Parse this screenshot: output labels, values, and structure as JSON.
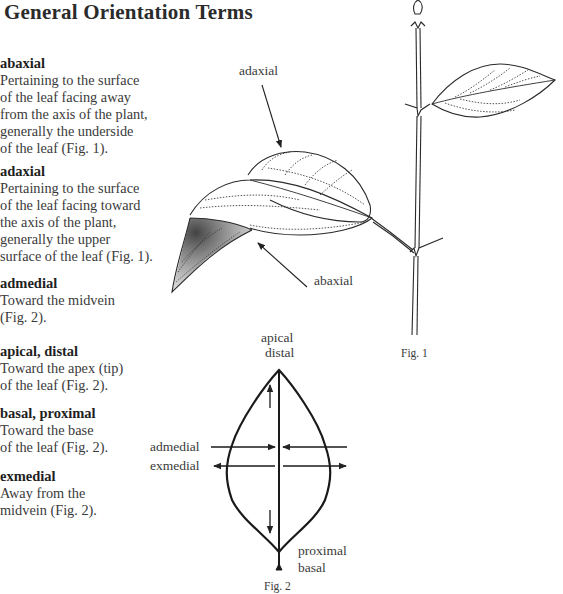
{
  "page": {
    "title": "General Orientation Terms"
  },
  "terms": [
    {
      "name": "abaxial",
      "definition": "Pertaining to the surface\nof the leaf facing away\nfrom the axis of the plant,\ngenerally the underside\nof the leaf (Fig. 1)."
    },
    {
      "name": "adaxial",
      "definition": "Pertaining to the surface\nof the leaf facing toward\nthe axis of the plant,\ngenerally the upper\nsurface of the leaf (Fig. 1)."
    },
    {
      "name": "admedial",
      "definition": "Toward the midvein\n(Fig. 2)."
    },
    {
      "name": "apical, distal",
      "definition": "Toward the apex (tip)\nof the leaf (Fig. 2)."
    },
    {
      "name": "basal, proximal",
      "definition": "Toward the base\nof the leaf (Fig. 2)."
    },
    {
      "name": "exmedial",
      "definition": "Away from the\nmidvein (Fig. 2)."
    }
  ],
  "figure1": {
    "caption": "Fig. 1",
    "labels": {
      "adaxial": "adaxial",
      "abaxial": "abaxial"
    }
  },
  "figure2": {
    "caption": "Fig. 2",
    "labels": {
      "apical": "apical",
      "distal": "distal",
      "admedial": "admedial",
      "exmedial": "exmedial",
      "proximal": "proximal",
      "basal": "basal"
    }
  }
}
